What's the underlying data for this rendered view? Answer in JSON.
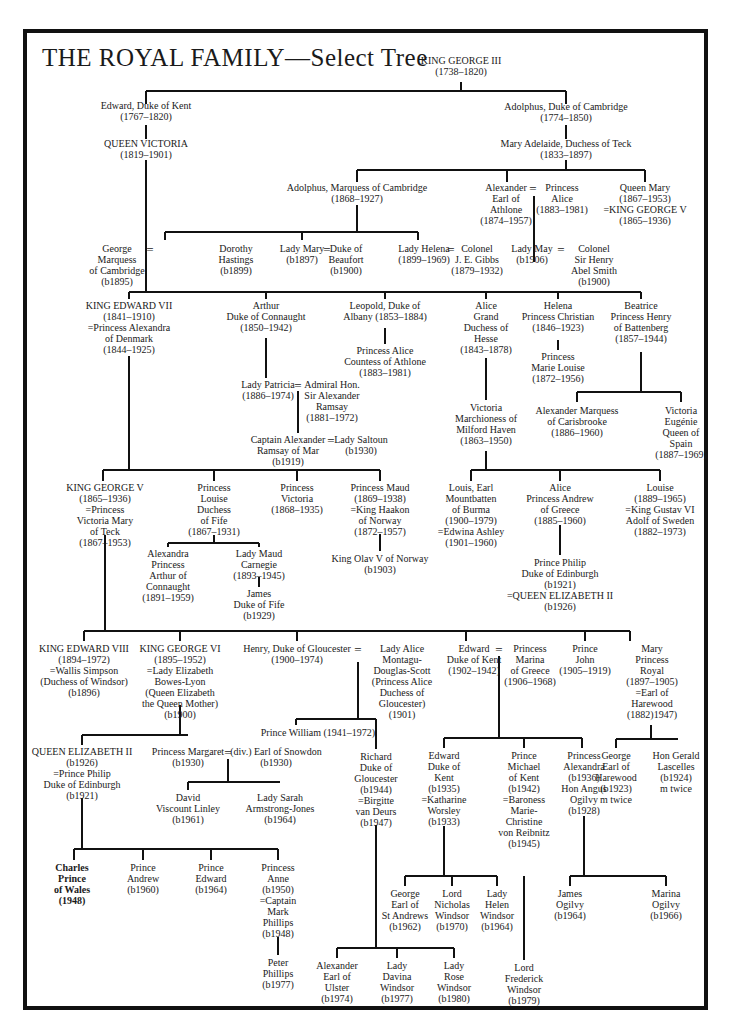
{
  "title": "THE ROYAL FAMILY—Select Tree",
  "colors": {
    "ink": "#1a1a1a",
    "frame": "#111111",
    "background": "#ffffff"
  },
  "people": {
    "george3": "KING GEORGE III\n(1738–1820)",
    "edward_kent": "Edward, Duke of Kent\n(1767–1820)",
    "victoria": "QUEEN VICTORIA\n(1819–1901)",
    "adolphus_cambridge": "Adolphus, Duke of Cambridge\n(1774–1850)",
    "mary_adelaide": "Mary Adelaide, Duchess of Teck\n(1833–1897)",
    "adolphus_marquess": "Adolphus, Marquess of Cambridge\n(1868–1927)",
    "alexander_athlone": "Alexander\nEarl of\nAthlone\n(1874–1957)",
    "princess_alice_athlone": "Princess\nAlice\n(1883–1981)",
    "queen_mary": "Queen Mary\n(1867–1953)\n=KING GEORGE V\n(1865–1936)",
    "george_marquess": "George\nMarquess\nof Cambridge\n(b1895)",
    "dorothy_hastings": "Dorothy\nHastings\n(b1899)",
    "lady_mary": "Lady Mary\n(b1897)",
    "duke_beaufort": "Duke of\nBeaufort\n(b1900)",
    "lady_helena": "Lady Helena\n(1899–1969)",
    "colonel_gibbs": "Colonel\nJ. E. Gibbs\n(1879–1932)",
    "lady_may": "Lady May\n(b1906)",
    "colonel_abel_smith": "Colonel\nSir Henry\nAbel Smith\n(b1900)",
    "edward7": "KING EDWARD VII\n(1841–1910)\n=Princess Alexandra\nof Denmark\n(1844–1925)",
    "arthur_connaught": "Arthur\nDuke of Connaught\n(1850–1942)",
    "leopold_albany": "Leopold, Duke of\nAlbany (1853–1884)",
    "alice_countess_athlone": "Princess Alice\nCountess of Athlone\n(1883–1981)",
    "alice_hesse": "Alice\nGrand\nDuchess of\nHesse\n(1843–1878)",
    "helena_christian": "Helena\nPrincess Christian\n(1846–1923)",
    "marie_louise": "Princess\nMarie Louise\n(1872–1956)",
    "beatrice": "Beatrice\nPrincess Henry\nof Battenberg\n(1857–1944)",
    "lady_patricia": "Lady Patricia\n(1886–1974)",
    "admiral_ramsay": "Admiral Hon.\nSir Alexander\nRamsay\n(1881–1972)",
    "captain_ramsay": "Captain Alexander\nRamsay of Mar\n(b1919)",
    "lady_saltoun": "Lady Saltoun\n(b1930)",
    "victoria_milford": "Victoria\nMarchioness of\nMilford Haven\n(1863–1950)",
    "alexander_carisbrooke": "Alexander Marquess\nof Carisbrooke\n(1886–1960)",
    "victoria_eugenie": "Victoria\nEugénie\nQueen of\nSpain\n(1887–1969)",
    "george5": "KING GEORGE V\n(1865–1936)\n=Princess\nVictoria Mary\nof Teck\n(1867–1953)",
    "louise_fife": "Princess\nLouise\nDuchess\nof Fife\n(1867–1931)",
    "princess_victoria": "Princess\nVictoria\n(1868–1935)",
    "princess_maud": "Princess Maud\n(1869–1938)\n=King Haakon\nof Norway\n(1872–1957)",
    "louis_mountbatten": "Louis, Earl\nMountbatten\nof Burma\n(1900–1979)\n=Edwina Ashley\n(1901–1960)",
    "alice_andrew": "Alice\nPrincess Andrew\nof Greece\n(1885–1960)",
    "louise_sweden": "Louise\n(1889–1965)\n=King Gustav VI\nAdolf of Sweden\n(1882–1973)",
    "alexandra_arthur": "Alexandra\nPrincess\nArthur of\nConnaught\n(1891–1959)",
    "maud_carnegie": "Lady Maud\nCarnegie\n(1893–1945)",
    "james_fife": "James\nDuke of Fife\n(b1929)",
    "olav5": "King Olav V of Norway\n(b1903)",
    "prince_philip_top": "Prince Philip\nDuke of Edinburgh\n(b1921)\n=QUEEN ELIZABETH II\n(b1926)",
    "edward8": "KING EDWARD VIII\n(1894–1972)\n=Wallis Simpson\n(Duchess of Windsor)\n(b1896)",
    "george6": "KING GEORGE VI\n(1895–1952)\n=Lady Elizabeth\nBowes-Lyon\n(Queen Elizabeth\nthe Queen Mother)\n(b1900)",
    "henry_gloucester": "Henry, Duke of Gloucester\n(1900–1974)",
    "alice_gloucester": "Lady Alice\nMontagu-\nDouglas-Scott\n(Princess Alice\nDuchess of\nGloucester)\n(1901)",
    "edward_kent_1902": "Edward\nDuke of Kent\n(1902–1942)",
    "marina": "Princess\nMarina\nof Greece\n(1906–1968)",
    "prince_john": "Prince\nJohn\n(1905–1919)",
    "mary_princess_royal": "Mary\nPrincess\nRoyal\n(1897–1905)\n=Earl of\nHarewood\n(1882)1947)",
    "elizabeth2": "QUEEN ELIZABETH II\n(b1926)\n=Prince Philip\nDuke of Edinburgh\n(b1921)",
    "margaret": "Princess Margaret\n(b1930)",
    "snowdon": "(div.) Earl of Snowdon\n(b1930)",
    "prince_william_gloucester": "Prince William (1941–1972)",
    "richard_gloucester": "Richard\nDuke of\nGloucester\n(b1944)\n=Birgitte\nvan Deurs\n(b1947)",
    "edward_kent_1935": "Edward\nDuke of\nKent\n(b1935)\n=Katharine\nWorsley\n(b1933)",
    "michael_kent": "Prince\nMichael\nof Kent\n(b1942)\n=Baroness\nMarie-\nChristine\nvon Reibnitz\n(b1945)",
    "alexandra_ogilvy": "Princess\nAlexandra\n(b1936)\nHon Angus\nOgilvy\n(b1928)",
    "george_harewood": "George\nEarl of\nHarewood\n(b1923)\nm twice",
    "gerald_lascelles": "Hon Gerald\nLascelles\n(b1924)\nm twice",
    "david_linley": "David\nViscount Linley\n(b1961)",
    "sarah_armstrong_jones": "Lady Sarah\nArmstrong-Jones\n(b1964)",
    "charles": "Charles\nPrince\nof Wales\n(1948)",
    "andrew": "Prince\nAndrew\n(b1960)",
    "edward_prince": "Prince\nEdward\n(b1964)",
    "anne": "Princess\nAnne\n(b1950)\n=Captain\nMark\nPhillips\n(b1948)",
    "peter_phillips": "Peter\nPhillips\n(b1977)",
    "alexander_ulster": "Alexander\nEarl of\nUlster\n(b1974)",
    "davina_windsor": "Lady\nDavina\nWindsor\n(b1977)",
    "rose_windsor": "Lady\nRose\nWindsor\n(b1980)",
    "george_st_andrews": "George\nEarl of\nSt Andrews\n(b1962)",
    "nicholas_windsor": "Lord\nNicholas\nWindsor\n(b1970)",
    "helen_windsor": "Lady\nHelen\nWindsor\n(b1964)",
    "frederick_windsor": "Lord\nFrederick\nWindsor\n(b1979)",
    "james_ogilvy": "James\nOgilvy\n(b1964)",
    "marina_ogilvy": "Marina\nOgilvy\n(b1966)"
  },
  "marriage_symbol": "="
}
